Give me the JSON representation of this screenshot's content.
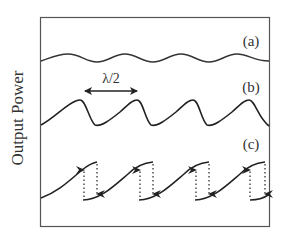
{
  "figure": {
    "y_axis_label": "Output Power",
    "annotation": "λ/2",
    "panels": [
      {
        "id": "a",
        "label": "(a)",
        "description": "small-amplitude sinusoidal output power vs displacement"
      },
      {
        "id": "b",
        "label": "(b)",
        "description": "asymmetric sawtooth-like waveform with period λ/2"
      },
      {
        "id": "c",
        "label": "(c)",
        "description": "hysteretic waveform with discontinuous jumps (dotted arrows up and down)"
      }
    ],
    "period_label": "λ/2",
    "colors": {
      "frame": "#444444",
      "curve": "#222222",
      "text": "#333333",
      "background": "#ffffff"
    }
  }
}
